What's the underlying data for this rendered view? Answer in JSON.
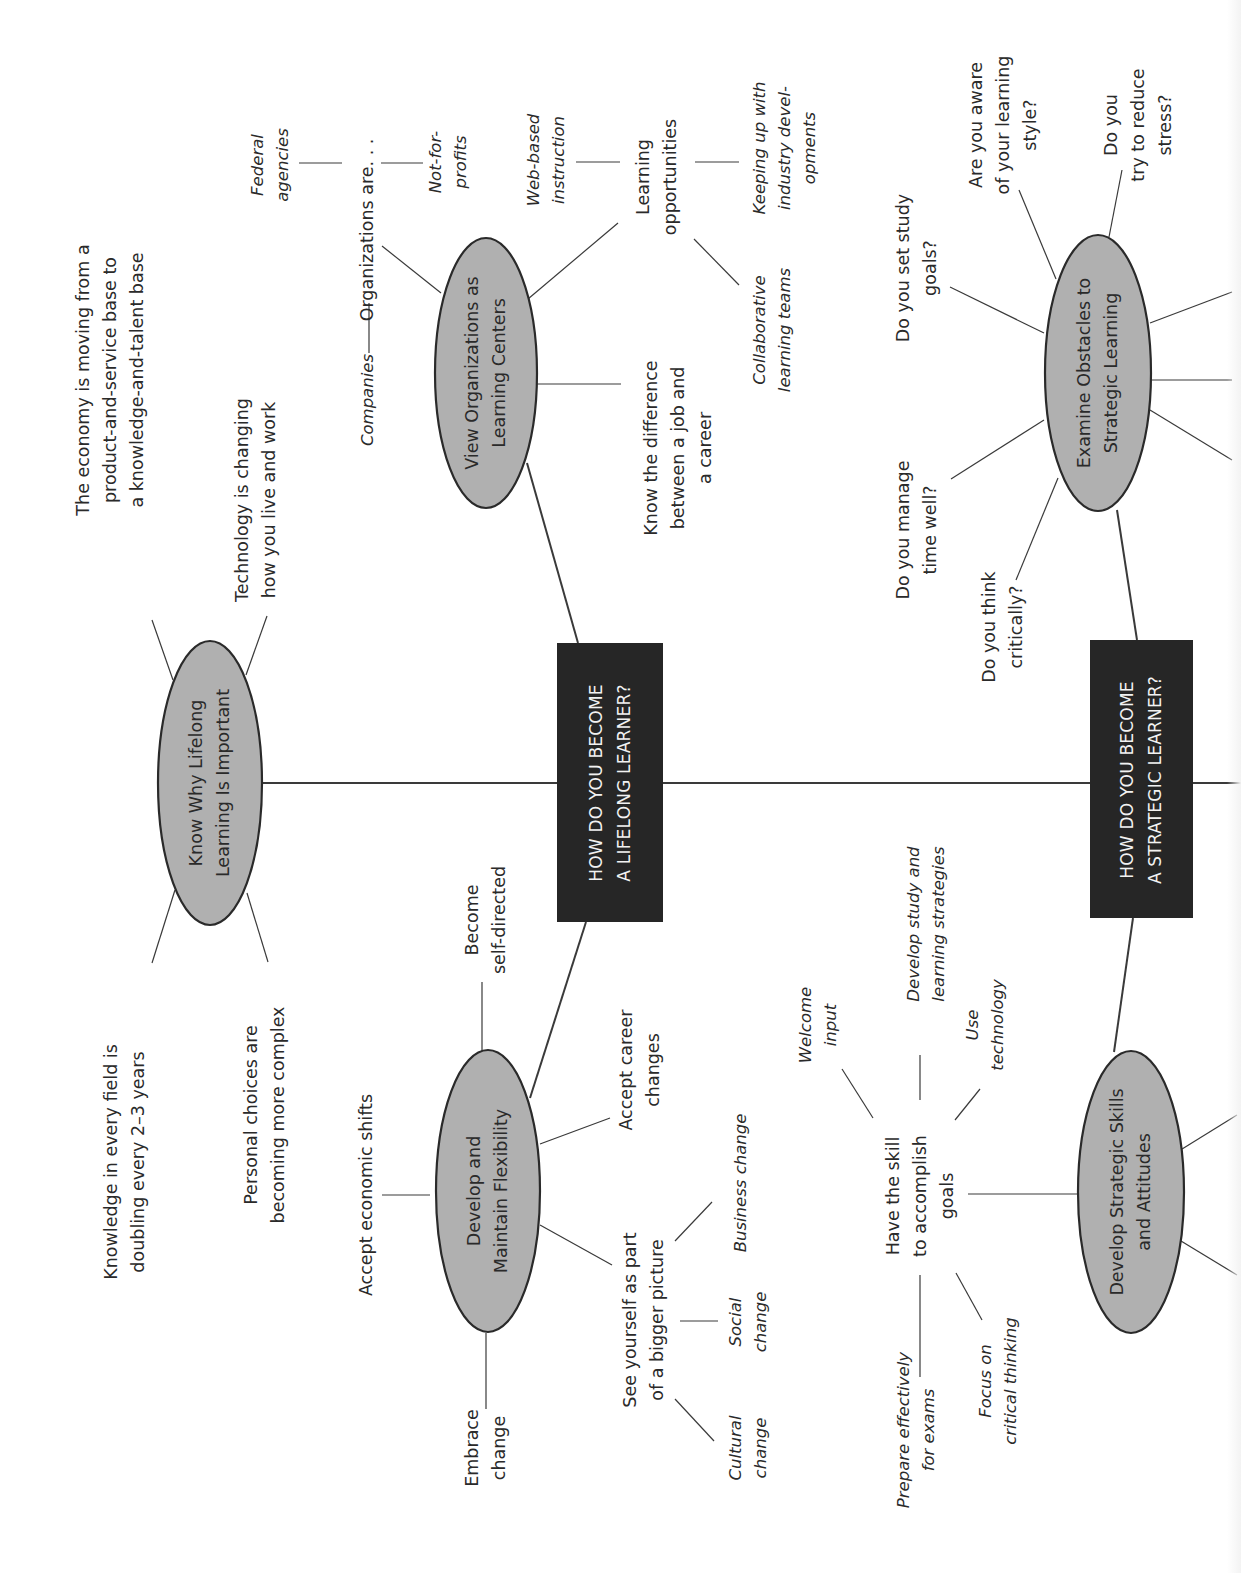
{
  "diagram": {
    "type": "mind-map",
    "orientation": "rotated-90-ccw",
    "colors": {
      "hub_fill": "#262626",
      "hub_text": "#f2f2f2",
      "node_fill": "#b0b0b0",
      "node_stroke": "#2a2a2a",
      "line": "#3a3a3a",
      "text": "#2a2a2a"
    },
    "hubs": [
      {
        "id": "lifelong",
        "label": "HOW DO YOU BECOME\nA LIFELONG LEARNER?"
      },
      {
        "id": "strategic",
        "label": "HOW DO YOU BECOME\nA STRATEGIC LEARNER?"
      }
    ],
    "nodes": {
      "know_why": {
        "label": "Know Why Lifelong\nLearning Is Important",
        "children": [
          "The economy is moving from a\nproduct-and-service base to\na knowledge-and-talent base",
          "Technology is changing\nhow you live and work",
          "Knowledge in every field is\ndoubling every 2–3 years",
          "Personal choices are\nbecoming more complex"
        ]
      },
      "view_orgs": {
        "label": "View Organizations as\nLearning Centers",
        "children": {
          "organizations": {
            "label": "Organizations are. . .",
            "items": [
              "Companies",
              "Federal\nagencies",
              "Not-for-\nprofits"
            ]
          },
          "learning_opportunities": {
            "label": "Learning\nopportunities",
            "items": [
              "Web-based\ninstruction",
              "Keeping up with\nindustry devel-\nopments",
              "Collaborative\nlearning teams"
            ]
          },
          "know_difference": "Know the difference\nbetween a job and\na career"
        }
      },
      "flexibility": {
        "label": "Develop and\nMaintain Flexibility",
        "children": {
          "self_directed": "Become\nself-directed",
          "economic_shifts": "Accept economic shifts",
          "career_changes": "Accept career\nchanges",
          "embrace_change": "Embrace\nchange",
          "bigger_picture": {
            "label": "See yourself as part\nof a bigger picture",
            "items": [
              "Business change",
              "Social\nchange",
              "Cultural\nchange"
            ]
          }
        }
      },
      "obstacles": {
        "label": "Examine Obstacles to\nStrategic Learning",
        "children": [
          "Do you think\ncritically?",
          "Do you manage\ntime well?",
          "Do you set study\ngoals?",
          "Are you aware\nof your learning\nstyle?",
          "Do you\ntry to reduce\nstress?"
        ]
      },
      "strategic_skills": {
        "label": "Develop Strategic Skills\nand Attitudes",
        "children": {
          "have_skill": {
            "label": "Have the skill\nto accomplish\ngoals",
            "items": [
              "Welcome\ninput",
              "Develop study and\nlearning strategies",
              "Use\ntechnology",
              "Prepare effectively\nfor exams",
              "Focus on\ncritical thinking"
            ]
          }
        }
      }
    }
  }
}
